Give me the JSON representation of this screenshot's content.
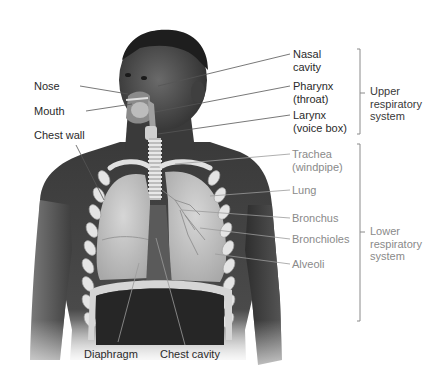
{
  "figure": {
    "labels_left": [
      {
        "id": "nose",
        "lines": [
          "Nose"
        ]
      },
      {
        "id": "mouth",
        "lines": [
          "Mouth"
        ]
      },
      {
        "id": "chest-wall",
        "lines": [
          "Chest wall"
        ]
      }
    ],
    "labels_upper": [
      {
        "id": "nasal-cavity",
        "lines": [
          "Nasal",
          "cavity"
        ]
      },
      {
        "id": "pharynx",
        "lines": [
          "Pharynx",
          "(throat)"
        ]
      },
      {
        "id": "larynx",
        "lines": [
          "Larynx",
          "(voice box)"
        ]
      }
    ],
    "labels_lower": [
      {
        "id": "trachea",
        "lines": [
          "Trachea",
          "(windpipe)"
        ]
      },
      {
        "id": "lung",
        "lines": [
          "Lung"
        ]
      },
      {
        "id": "bronchus",
        "lines": [
          "Bronchus"
        ]
      },
      {
        "id": "bronchioles",
        "lines": [
          "Bronchioles"
        ]
      },
      {
        "id": "alveoli",
        "lines": [
          "Alveoli"
        ]
      }
    ],
    "labels_bottom": [
      {
        "id": "diaphragm",
        "lines": [
          "Diaphragm"
        ]
      },
      {
        "id": "chest-cavity",
        "lines": [
          "Chest cavity"
        ]
      }
    ],
    "groups": [
      {
        "id": "upper",
        "lines": [
          "Upper",
          "respiratory",
          "system"
        ]
      },
      {
        "id": "lower",
        "lines": [
          "Lower",
          "respiratory",
          "system"
        ]
      }
    ],
    "colors": {
      "skin_dark": "#3c3c3c",
      "skin_mid": "#5a5a5a",
      "lung": "#c9c9c9",
      "rib": "#e6e6e6",
      "leader_dark": "#555555",
      "leader_grey": "#9a9a9a",
      "bracket": "#8a8a8a"
    }
  }
}
